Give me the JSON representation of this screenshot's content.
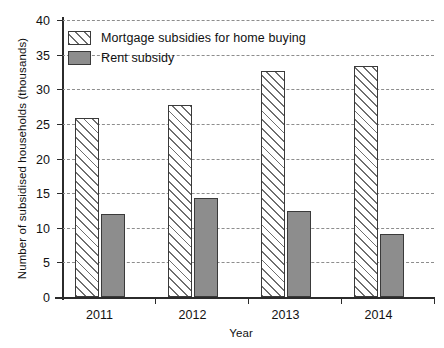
{
  "chart_data": {
    "type": "bar",
    "title": "",
    "subtitle": "",
    "xlabel": "Year",
    "ylabel": "Number of subsidised households (thousands)",
    "categories": [
      "2011",
      "2012",
      "2013",
      "2014"
    ],
    "series": [
      {
        "name": "Mortgage subsidies for home buying",
        "style": "hatched",
        "color": "#ffffff",
        "values": [
          25.8,
          27.8,
          32.7,
          33.4
        ]
      },
      {
        "name": "Rent subsidy",
        "style": "solid",
        "color": "#8d8d8d",
        "values": [
          12.0,
          14.3,
          12.4,
          9.1
        ]
      }
    ],
    "ylim": [
      0,
      40
    ],
    "yticks": [
      0,
      5,
      10,
      15,
      20,
      25,
      30,
      35,
      40
    ],
    "ytick_labels": [
      "0",
      "5",
      "10",
      "15",
      "20",
      "25",
      "30",
      "35",
      "40"
    ],
    "grid": true,
    "grid_axis": "y",
    "grid_style": "dashed",
    "legend_position": "upper-left",
    "legend": [
      "Mortgage subsidies for home buying",
      "Rent subsidy"
    ]
  },
  "axes": {
    "y_title": "Number of subsidised households (thousands)",
    "x_title": "Year"
  }
}
